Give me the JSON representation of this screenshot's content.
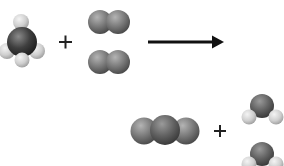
{
  "diagram": {
    "type": "chemical-reaction",
    "equation": "CH4 + 2 O2 → CO2 + 2 H2O",
    "reactants": [
      {
        "formula": "CH4",
        "name": "methane",
        "count": 1
      },
      {
        "formula": "O2",
        "name": "oxygen",
        "count": 2
      }
    ],
    "products": [
      {
        "formula": "CO2",
        "name": "carbon dioxide",
        "count": 1
      },
      {
        "formula": "H2O",
        "name": "water",
        "count": 2
      }
    ],
    "operators": {
      "plus_1": "+",
      "plus_2": "+",
      "arrow": "→"
    },
    "colors": {
      "background": "#ffffff",
      "carbon": "#3d3d3d",
      "oxygen": "#7a7a7a",
      "hydrogen": "#d6d6d6",
      "arrow": "#111111"
    }
  }
}
